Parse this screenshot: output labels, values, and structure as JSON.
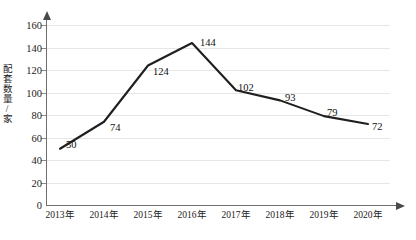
{
  "chart_data": {
    "type": "line",
    "title": "",
    "xlabel": "",
    "ylabel": "配套数量/家",
    "categories": [
      "2013年",
      "2014年",
      "2015年",
      "2016年",
      "2017年",
      "2018年",
      "2019年",
      "2020年"
    ],
    "values": [
      50,
      74,
      124,
      144,
      102,
      93,
      79,
      72
    ],
    "point_labels": [
      "50",
      "74",
      "124",
      "144",
      "102",
      "93",
      "79",
      "72"
    ],
    "ylim": [
      0,
      160
    ],
    "ytick_labels": [
      "0",
      "20",
      "40",
      "60",
      "80",
      "100",
      "120",
      "140",
      "160"
    ],
    "ytick_values": [
      0,
      20,
      40,
      60,
      80,
      100,
      120,
      140,
      160
    ],
    "grid": true,
    "legend": "none",
    "series_color": "#1f1f1f",
    "grid_color": "#e6e6e6",
    "axis_color": "#6f6f6f",
    "text_color": "#1a1a1a"
  }
}
